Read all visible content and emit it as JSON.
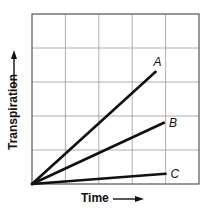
{
  "chart_data": {
    "type": "line",
    "title": "",
    "xlabel": "Time",
    "ylabel": "Transpiration",
    "xlim": [
      0,
      5
    ],
    "ylim": [
      0,
      5
    ],
    "grid": true,
    "grid_divisions": {
      "x": 5,
      "y": 5
    },
    "tick_labels": {
      "x": [],
      "y": []
    },
    "axis_arrows": true,
    "units": "grid units (no numeric scale shown)",
    "series": [
      {
        "name": "A",
        "x": [
          0,
          3.7
        ],
        "y": [
          0,
          3.3
        ]
      },
      {
        "name": "B",
        "x": [
          0,
          3.95
        ],
        "y": [
          0,
          1.8
        ]
      },
      {
        "name": "C",
        "x": [
          0,
          4.0
        ],
        "y": [
          0,
          0.3
        ]
      }
    ],
    "legend": "none (direct labels at line ends)",
    "colors": {
      "line": "#111111",
      "grid": "#9a9a9a",
      "frame": "#555555",
      "background": "#ffffff"
    }
  }
}
